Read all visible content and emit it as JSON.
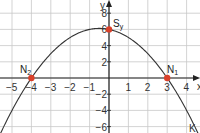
{
  "chart_data": {
    "type": "line",
    "title": "",
    "xlabel": "x",
    "ylabel": "y",
    "xlim": [
      -5.6,
      4.7
    ],
    "ylim": [
      -6.8,
      8.2
    ],
    "grid": true,
    "x_ticks": [
      -5,
      -4,
      -3,
      -2,
      -1,
      1,
      2,
      3,
      4
    ],
    "x_tick_labels": [
      "−5",
      "−4",
      "−3",
      "−2",
      "−1",
      "1",
      "2",
      "3",
      "4"
    ],
    "y_ticks": [
      8,
      6,
      4,
      2,
      -2,
      -4,
      -6
    ],
    "y_tick_labels": [
      "8",
      "6",
      "4",
      "2",
      "−2",
      "−4",
      "−6"
    ],
    "series": [
      {
        "name": "K",
        "function": "y = -0.5x^2 - 0.5x + 6",
        "x": [
          -5.6,
          -5,
          -4,
          -3,
          -2,
          -1,
          -0.5,
          0,
          1,
          2,
          3,
          4,
          4.4
        ],
        "y": [
          -6.88,
          -4,
          0,
          3,
          5,
          6,
          6.125,
          6,
          5,
          3,
          0,
          -4,
          -5.88
        ]
      }
    ],
    "points": [
      {
        "label": "S",
        "sub": "y",
        "x": 0,
        "y": 6,
        "color": "#d9412b"
      },
      {
        "label": "N",
        "sub": "2",
        "x": -4,
        "y": 0,
        "color": "#d9412b"
      },
      {
        "label": "N",
        "sub": "1",
        "x": 3,
        "y": 0,
        "color": "#d9412b"
      }
    ],
    "annotations": [
      {
        "text": "K",
        "x": 4.5,
        "y": -6,
        "note": "curve label"
      }
    ]
  },
  "labels": {
    "x_axis": "x",
    "y_axis": "y",
    "curve": "K",
    "sy_main": "S",
    "sy_sub": "y",
    "n1_main": "N",
    "n1_sub": "1",
    "n2_main": "N",
    "n2_sub": "2"
  },
  "colors": {
    "point": "#d9412b",
    "grid": "#c8c8c8",
    "axis": "#222222",
    "curve": "#333333"
  }
}
